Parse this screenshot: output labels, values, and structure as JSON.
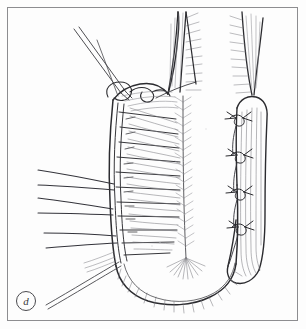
{
  "figure": {
    "panel_label": "d",
    "label_style": "circled-italic-lowercase",
    "domain_subject": "surgical line-art illustration",
    "background_color": "#fdfdfd",
    "ink_color": "#2b2b2f",
    "line_color_light": "#6a6a70",
    "frame_color": "#8d8d90",
    "frame_inset_px": 7,
    "canvas": {
      "width": 306,
      "height": 329
    }
  },
  "elements": {
    "needle_holder": {
      "name": "needle-holder-instrument",
      "count": 1,
      "entry": "upper-left",
      "tip_at": "suture-knot-top"
    },
    "suture_knot_top": {
      "name": "top-suture-loop",
      "count": 1,
      "position": "upper-middle"
    },
    "laced_running_suture": {
      "name": "laced-corset-suture",
      "rung_count": 11,
      "orientation": "vertical",
      "side": "left-margin-of-shaft"
    },
    "interrupted_sutures_right": {
      "name": "interrupted-knot-suture",
      "count": 4,
      "side": "right-flap-margin"
    },
    "retracted_threads_left": {
      "name": "retracted-suture-thread",
      "count": 6,
      "direction": "left"
    },
    "tissue_flaps_top": {
      "name": "feathered-tissue-flap",
      "count": 2,
      "position": "top-right"
    },
    "midline_raphe": {
      "name": "midline-raphe-line",
      "count": 1,
      "feathered": true
    },
    "distal_tip": {
      "name": "rounded-distal-tip",
      "hatching": "radiating"
    }
  }
}
